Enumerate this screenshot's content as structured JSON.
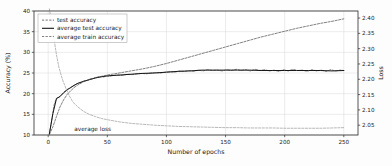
{
  "chart_data": {
    "type": "line",
    "title": "",
    "xlabel": "Number of epochs",
    "ylabel": "Accuracy (%)",
    "y2label": "Loss",
    "xlim": [
      -12,
      262
    ],
    "ylim": [
      10,
      40
    ],
    "y2lim": [
      2.018,
      2.423
    ],
    "grid": true,
    "legend_position": "upper left",
    "xticks": [
      0,
      50,
      100,
      150,
      200,
      250
    ],
    "xticklabels": [
      "0",
      "50",
      "100",
      "150",
      "200",
      "250"
    ],
    "yticks": [
      10,
      15,
      20,
      25,
      30,
      35,
      40
    ],
    "yticklabels": [
      "10",
      "15",
      "20",
      "25",
      "30",
      "35",
      "40"
    ],
    "y2ticks": [
      2.05,
      2.1,
      2.15,
      2.2,
      2.25,
      2.3,
      2.35,
      2.4
    ],
    "y2ticklabels": [
      "2.05",
      "2.10",
      "2.15",
      "2.20",
      "2.25",
      "2.30",
      "2.35",
      "2.40"
    ],
    "annotations": [
      {
        "text": "average loss",
        "x": 22,
        "y": 10.9,
        "axis": "left"
      }
    ],
    "series": [
      {
        "name": "test accuracy",
        "axis": "left",
        "style": "dashed",
        "color": "#3a3a3a",
        "width": 0.6,
        "x": [
          1,
          3,
          5,
          7,
          9,
          11,
          13,
          15,
          17,
          19,
          21,
          23,
          25,
          27,
          29,
          31,
          33,
          35,
          37,
          39,
          41,
          43,
          45,
          47,
          49,
          51,
          55,
          59,
          63,
          67,
          71,
          75,
          79,
          83,
          87,
          91,
          95,
          99,
          103,
          107,
          111,
          115,
          119,
          123,
          127,
          131,
          135,
          139,
          143,
          147,
          151,
          155,
          159,
          163,
          167,
          171,
          175,
          179,
          183,
          187,
          191,
          195,
          199,
          203,
          207,
          211,
          215,
          219,
          223,
          227,
          231,
          235,
          239,
          243,
          247,
          250
        ],
        "y": [
          10.2,
          13.6,
          17.3,
          18.9,
          19.2,
          19.6,
          20.3,
          20.8,
          21.2,
          21.4,
          21.9,
          22.2,
          22.5,
          22.6,
          22.9,
          23.1,
          23.2,
          23.5,
          23.6,
          23.7,
          23.9,
          24.0,
          24.1,
          24.0,
          24.3,
          24.2,
          24.4,
          24.5,
          24.4,
          24.7,
          24.6,
          24.8,
          24.9,
          24.8,
          25.0,
          25.1,
          25.0,
          25.2,
          25.3,
          25.2,
          25.5,
          25.4,
          25.6,
          25.4,
          25.7,
          25.5,
          25.8,
          25.6,
          25.7,
          25.5,
          25.8,
          25.6,
          25.9,
          25.6,
          25.8,
          25.5,
          25.9,
          25.6,
          25.8,
          25.5,
          25.7,
          25.4,
          25.8,
          25.5,
          25.9,
          25.6,
          25.7,
          25.4,
          25.8,
          25.5,
          25.7,
          25.4,
          25.8,
          25.5,
          25.7,
          25.6
        ]
      },
      {
        "name": "average test accuracy",
        "axis": "left",
        "style": "solid",
        "color": "#151515",
        "width": 1.0,
        "x": [
          1,
          4,
          7,
          10,
          13,
          16,
          19,
          22,
          25,
          30,
          35,
          40,
          45,
          50,
          60,
          70,
          80,
          90,
          100,
          110,
          120,
          130,
          140,
          150,
          160,
          170,
          180,
          190,
          200,
          210,
          220,
          230,
          240,
          250
        ],
        "y": [
          10.3,
          15.2,
          18.8,
          19.3,
          20.2,
          20.9,
          21.5,
          22.0,
          22.5,
          23.0,
          23.4,
          23.8,
          24.1,
          24.3,
          24.5,
          24.7,
          24.9,
          25.0,
          25.2,
          25.4,
          25.5,
          25.7,
          25.7,
          25.7,
          25.7,
          25.7,
          25.6,
          25.6,
          25.6,
          25.6,
          25.6,
          25.6,
          25.5,
          25.6
        ]
      },
      {
        "name": "average train accuracy",
        "axis": "left",
        "style": "dashed",
        "color": "#4a4a4a",
        "width": 0.7,
        "x": [
          1,
          4,
          7,
          10,
          13,
          16,
          19,
          22,
          25,
          30,
          35,
          40,
          45,
          50,
          60,
          70,
          80,
          90,
          100,
          110,
          120,
          130,
          140,
          150,
          160,
          170,
          180,
          190,
          200,
          210,
          220,
          230,
          240,
          250
        ],
        "y": [
          10.1,
          12.0,
          14.5,
          16.8,
          18.5,
          19.8,
          20.7,
          21.5,
          22.1,
          22.9,
          23.4,
          23.9,
          24.2,
          24.5,
          25.0,
          25.5,
          26.0,
          26.6,
          27.3,
          28.1,
          28.9,
          29.7,
          30.5,
          31.3,
          32.1,
          32.9,
          33.7,
          34.4,
          35.1,
          35.8,
          36.4,
          37.0,
          37.5,
          38.1
        ]
      },
      {
        "name": "average loss",
        "axis": "right",
        "style": "dashed",
        "color": "#9a9a9a",
        "width": 0.7,
        "x": [
          1,
          3,
          5,
          7,
          9,
          12,
          15,
          18,
          21,
          25,
          30,
          35,
          40,
          45,
          50,
          60,
          70,
          80,
          90,
          100,
          110,
          120,
          130,
          140,
          150,
          160,
          170,
          180,
          190,
          200,
          210,
          220,
          230,
          240,
          250
        ],
        "y": [
          2.43,
          2.38,
          2.33,
          2.28,
          2.24,
          2.2,
          2.17,
          2.145,
          2.125,
          2.11,
          2.095,
          2.085,
          2.078,
          2.072,
          2.068,
          2.061,
          2.056,
          2.053,
          2.05,
          2.048,
          2.046,
          2.045,
          2.044,
          2.043,
          2.042,
          2.042,
          2.041,
          2.041,
          2.041,
          2.04,
          2.04,
          2.04,
          2.04,
          2.041,
          2.042
        ]
      }
    ],
    "legend_entries": [
      {
        "label": "test accuracy",
        "style": "dashed",
        "color": "#3a3a3a"
      },
      {
        "label": "average test accuracy",
        "style": "solid",
        "color": "#151515"
      },
      {
        "label": "average train accuracy",
        "style": "dashed",
        "color": "#4a4a4a"
      }
    ]
  }
}
